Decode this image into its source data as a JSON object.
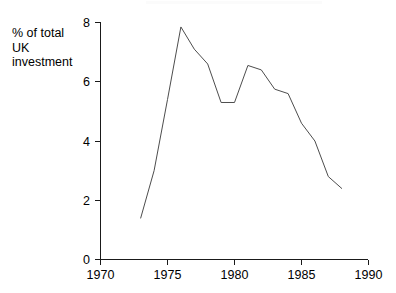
{
  "chart_data": {
    "type": "line",
    "title": "",
    "subtitle": "",
    "xlabel": "",
    "ylabel": "% of total\nUK\ninvestment",
    "ylabel_lines": [
      "% of total",
      "UK",
      "investment"
    ],
    "x": [
      1973,
      1974,
      1975,
      1976,
      1977,
      1978,
      1979,
      1980,
      1981,
      1982,
      1983,
      1984,
      1985,
      1986,
      1987,
      1988
    ],
    "values": [
      1.4,
      3.0,
      5.4,
      7.85,
      7.1,
      6.6,
      5.3,
      5.3,
      6.55,
      6.4,
      5.75,
      5.6,
      4.6,
      4.0,
      2.8,
      2.4
    ],
    "series": [
      {
        "name": "% of total UK investment",
        "values": [
          1.4,
          3.0,
          5.4,
          7.85,
          7.1,
          6.6,
          5.3,
          5.3,
          6.55,
          6.4,
          5.75,
          5.6,
          4.6,
          4.0,
          2.8,
          2.4
        ]
      }
    ],
    "xlim": [
      1970,
      1990
    ],
    "ylim": [
      0,
      8
    ],
    "xticks": [
      1970,
      1975,
      1980,
      1985,
      1990
    ],
    "xtick_labels": [
      "1970",
      "1975",
      "1980",
      "1985",
      "1990"
    ],
    "yticks": [
      0,
      2,
      4,
      6,
      8
    ],
    "ytick_labels": [
      "0",
      "2",
      "4",
      "6",
      "8"
    ],
    "grid": false,
    "legend": false,
    "legend_position": "none",
    "line_color": "#4d4d4d",
    "axis_color": "#1a1a1a",
    "background_color": "#ffffff",
    "annotations": []
  },
  "axes": {
    "y_axis_name": "y-axis",
    "x_axis_name": "x-axis"
  }
}
